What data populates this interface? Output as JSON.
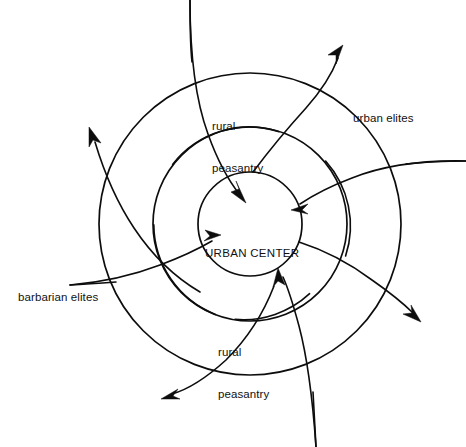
{
  "diagram": {
    "type": "radial-flow",
    "title_text_center": "URBAN CENTER",
    "background_color": "#ffffff",
    "line_color": "#0d0d0d",
    "center_point": {
      "x": 250,
      "y": 224
    },
    "rings": [
      {
        "name": "inner-circle",
        "radius": 52
      },
      {
        "name": "middle-circle",
        "radius": 97
      },
      {
        "name": "outer-circle",
        "radius": 151
      }
    ],
    "labels": [
      {
        "id": "rural-peasantry-top",
        "lines": [
          "rural",
          "peasantry"
        ],
        "x": 212,
        "y": 91,
        "align": "left"
      },
      {
        "id": "urban-elites",
        "lines": [
          "urban elites"
        ],
        "x": 353,
        "y": 83,
        "align": "left"
      },
      {
        "id": "barbarian-elites",
        "lines": [
          "barbarian elites"
        ],
        "x": 18,
        "y": 262,
        "align": "left"
      },
      {
        "id": "rural-peasantry-bottom",
        "lines": [
          "rural",
          "peasantry"
        ],
        "x": 218,
        "y": 317,
        "align": "left"
      },
      {
        "id": "urban-center",
        "lines": [
          "URBAN CENTER"
        ],
        "x": 205,
        "y": 228,
        "align": "left"
      }
    ],
    "inward_arrows": [
      {
        "id": "inflow-from-top",
        "direction": "into-center",
        "target_angle_deg": 100
      },
      {
        "id": "inflow-from-upper-right",
        "direction": "into-center",
        "target_angle_deg": 35
      },
      {
        "id": "inflow-from-lower-right",
        "direction": "into-center",
        "target_angle_deg": -55
      },
      {
        "id": "inflow-from-left",
        "direction": "into-center",
        "target_angle_deg": 200
      }
    ],
    "outward_arrows": [
      {
        "id": "outflow-upper-left",
        "direction": "out-of-center",
        "tip": {
          "x": 88,
          "y": 129
        }
      },
      {
        "id": "outflow-upper-right",
        "direction": "out-of-center",
        "tip": {
          "x": 342,
          "y": 48
        }
      },
      {
        "id": "outflow-lower-right",
        "direction": "out-of-center",
        "tip": {
          "x": 419,
          "y": 319
        }
      },
      {
        "id": "outflow-lower-left",
        "direction": "out-of-center",
        "tip": {
          "x": 164,
          "y": 398
        }
      }
    ]
  }
}
